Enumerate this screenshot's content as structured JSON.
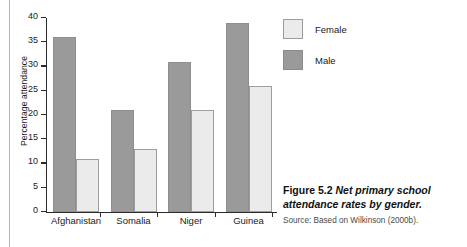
{
  "chart_data": {
    "type": "bar",
    "title": "Net primary school attendance rates by gender.",
    "xlabel": "",
    "ylabel": "Percentage attendance",
    "ylim": [
      0,
      40
    ],
    "yticks": [
      0,
      5,
      10,
      15,
      20,
      25,
      30,
      35,
      40
    ],
    "grid": false,
    "legend_position": "top-right",
    "categories": [
      "Afghanistan",
      "Somalia",
      "Niger",
      "Guinea"
    ],
    "series": [
      {
        "name": "Male",
        "values": [
          36,
          21,
          31,
          39
        ],
        "color": "#9a9a9a"
      },
      {
        "name": "Female",
        "values": [
          11,
          13,
          21,
          26
        ],
        "color": "#ebebeb"
      }
    ],
    "series_order_in_plot": [
      "Male",
      "Female"
    ],
    "legend_order": [
      "Female",
      "Male"
    ]
  },
  "legend": {
    "items": [
      {
        "label": "Female",
        "swatch": "female"
      },
      {
        "label": "Male",
        "swatch": "male"
      }
    ]
  },
  "caption": {
    "figure_number": "Figure 5.2",
    "title": "Net primary school attendance rates by gender.",
    "source": "Source: Based on Wilkinson (2000b)."
  }
}
